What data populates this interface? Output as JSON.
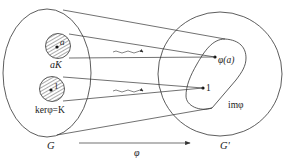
{
  "diagram": {
    "type": "group-homomorphism-kernel-image",
    "colors": {
      "stroke": "#333333",
      "text": "#222222",
      "hatch": "#555555"
    },
    "domain_group": {
      "label": "G"
    },
    "codomain_group": {
      "label": "G'"
    },
    "coset": {
      "label": "aK",
      "point_label": "a"
    },
    "kernel": {
      "label": "kerφ=K",
      "point_label": "1"
    },
    "image": {
      "label": "imφ"
    },
    "image_points": [
      {
        "label": "φ(a)"
      },
      {
        "label": "1"
      }
    ],
    "map_arrow": {
      "label": "φ"
    }
  }
}
